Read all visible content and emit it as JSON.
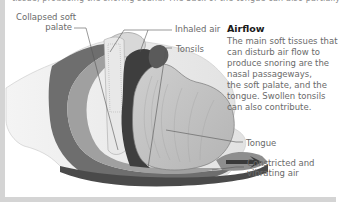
{
  "top_text": "tissue, producing the snoring sound. The back of the tongue can also partially or totally block the airway.",
  "labels": {
    "collapsed_soft_palate_line1": "Collapsed soft",
    "collapsed_soft_palate_line2": "palate",
    "inhaled_air": "Inhaled air",
    "tonsils": "Tonsils",
    "tongue": "Tongue",
    "constricted_line1": "Constricted and",
    "constricted_line2": "vibrating air"
  },
  "airflow": {
    "title": "Airflow",
    "lines": [
      "The main soft tissues that",
      "can disturb air flow to",
      "produce snoring are the",
      "nasal passageways,",
      "the soft palate, and the",
      "tongue. Swollen tonsils",
      "can also contribute."
    ]
  },
  "colors": {
    "border": "#d4d4d4",
    "label_text": "#6a6a6a",
    "title_text": "#1a1a1a",
    "tissue_dark": "#4a4a4a",
    "tissue_mid": "#8c8c8c",
    "tissue_light": "#c8c8c8"
  }
}
